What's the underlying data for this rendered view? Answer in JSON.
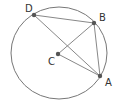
{
  "diagram": {
    "type": "circle-geometry",
    "circle": {
      "cx": 59,
      "cy": 53,
      "rx": 48,
      "ry": 46,
      "stroke": "#777777"
    },
    "points": {
      "D": {
        "label": "D",
        "x": 34,
        "y": 15,
        "lx": 25,
        "ly": 12
      },
      "B": {
        "label": "B",
        "x": 94,
        "y": 23,
        "lx": 99,
        "ly": 21
      },
      "C": {
        "label": "C",
        "x": 58,
        "y": 54,
        "lx": 48,
        "ly": 65
      },
      "A": {
        "label": "A",
        "x": 100,
        "y": 76,
        "lx": 105,
        "ly": 86
      }
    },
    "segments": [
      [
        "D",
        "B"
      ],
      [
        "D",
        "A"
      ],
      [
        "B",
        "A"
      ],
      [
        "C",
        "B"
      ],
      [
        "C",
        "A"
      ]
    ],
    "line_color": "#888888",
    "point_color": "#555555"
  }
}
